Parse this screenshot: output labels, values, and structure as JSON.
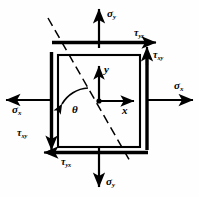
{
  "figure": {
    "type": "stress-element-diagram",
    "caption": "",
    "stroke_color": "#000000",
    "background_color": "#ffffff"
  },
  "element": {
    "shape": "square",
    "x": 58,
    "y": 55,
    "width": 82,
    "height": 92
  },
  "axes": {
    "x_label": "x",
    "y_label": "y",
    "origin": {
      "x": 99,
      "y": 101
    }
  },
  "angle": {
    "symbol": "θ",
    "name": "theta"
  },
  "inclined_plane": {
    "style": "dashed",
    "start": {
      "x": 48,
      "y": 18
    },
    "end": {
      "x": 131,
      "y": 163
    }
  },
  "labels": {
    "sigma_y_top": {
      "greek": "σ",
      "sub": "y",
      "position": "top"
    },
    "sigma_y_bottom": {
      "greek": "σ",
      "sub": "y",
      "position": "bottom"
    },
    "sigma_x_left": {
      "greek": "σ",
      "sub": "x",
      "position": "left"
    },
    "sigma_x_right": {
      "greek": "σ",
      "sub": "x",
      "position": "right"
    },
    "tau_yx_top": {
      "greek": "τ",
      "sub": "yx",
      "position": "top-right"
    },
    "tau_yx_bottom": {
      "greek": "τ",
      "sub": "yx",
      "position": "bottom-left"
    },
    "tau_xy_right": {
      "greek": "τ",
      "sub": "xy",
      "position": "right-top"
    },
    "tau_xy_left": {
      "greek": "τ",
      "sub": "xy",
      "position": "left-bottom"
    }
  }
}
